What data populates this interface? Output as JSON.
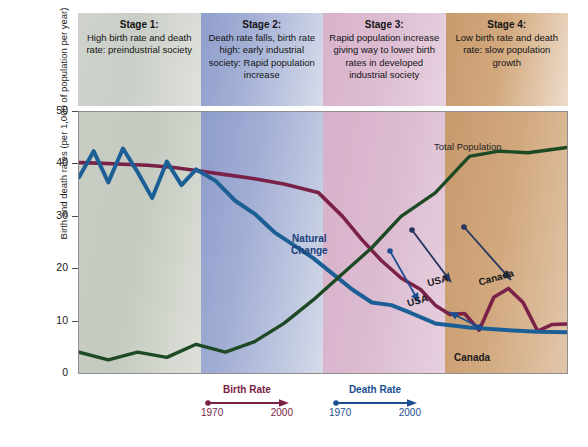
{
  "stages": [
    {
      "title": "Stage 1:",
      "description": "High birth rate and death rate: preindustrial society"
    },
    {
      "title": "Stage 2:",
      "description": "Death rate falls, birth rate high: early industrial society: Rapid population increase"
    },
    {
      "title": "Stage 3:",
      "description": "Rapid population increase giving way to lower birth rates in developed industrial society"
    },
    {
      "title": "Stage 4:",
      "description": "Low birth rate and death rate: slow population growth"
    }
  ],
  "axis": {
    "y_title": "Birth and death rates (per 1,000 of population per year)",
    "y_ticks": [
      "50",
      "40",
      "30",
      "20",
      "10",
      "0"
    ]
  },
  "annotations": {
    "total_population": "Total Population",
    "natural_change_line1": "Natural",
    "natural_change_line2": "Change",
    "usa_birth": "USA",
    "usa_death": "USA",
    "canada_birth": "Canada",
    "canada_death": "Canada"
  },
  "legend": {
    "birth": {
      "label": "Birth Rate",
      "year_start": "1970",
      "year_end": "2000",
      "color": "#7a2147"
    },
    "death": {
      "label": "Death Rate",
      "year_start": "1970",
      "year_end": "2000",
      "color": "#1b4f91"
    }
  },
  "chart_data": {
    "type": "line",
    "xlabel": "",
    "ylabel": "Birth and death rates (per 1,000 of population per year)",
    "ylim": [
      0,
      50
    ],
    "ytick_values": [
      0,
      10,
      20,
      30,
      40,
      50
    ],
    "grid": false,
    "legend_position": "bottom",
    "stage_boundaries_pct": [
      0,
      24,
      49,
      73,
      100
    ],
    "series": [
      {
        "name": "Birth Rate",
        "color": "#7a2147",
        "x": [
          0,
          4,
          9,
          14,
          19,
          24,
          30,
          36,
          42,
          49,
          54,
          58,
          62,
          66,
          70,
          73,
          76,
          79,
          82,
          85,
          88,
          91,
          94,
          97,
          100
        ],
        "values": [
          40.3,
          40.2,
          40.0,
          39.8,
          39.4,
          38.8,
          38.0,
          37.2,
          36.2,
          34.6,
          30.0,
          25.5,
          21.5,
          18.2,
          16.0,
          13.0,
          11.2,
          11.4,
          8.2,
          14.5,
          16.2,
          13.5,
          8.0,
          9.3,
          9.4
        ]
      },
      {
        "name": "Death Rate",
        "color": "#1b5f96",
        "x": [
          0,
          3,
          6,
          9,
          12,
          15,
          18,
          21,
          24,
          28,
          32,
          36,
          40,
          44,
          48,
          52,
          56,
          60,
          64,
          68,
          73,
          80,
          88,
          94,
          100
        ],
        "values": [
          37.5,
          42.5,
          36.5,
          43.0,
          38.5,
          33.5,
          40.5,
          36.0,
          39.0,
          36.8,
          33.0,
          30.5,
          27.0,
          24.5,
          22.0,
          19.0,
          16.0,
          13.5,
          13.0,
          11.5,
          9.5,
          8.7,
          8.2,
          7.9,
          7.8
        ]
      },
      {
        "name": "Total Population",
        "color": "#1d4a24",
        "x": [
          0,
          6,
          12,
          18,
          24,
          30,
          36,
          42,
          48,
          54,
          60,
          66,
          73,
          80,
          86,
          92,
          100
        ],
        "values": [
          4.0,
          2.5,
          4.0,
          3.0,
          5.5,
          4.0,
          6.0,
          9.5,
          14.0,
          19.0,
          24.0,
          30.0,
          34.5,
          41.5,
          42.5,
          42.2,
          43.2
        ]
      }
    ],
    "point_markers": [
      {
        "series": "Birth Rate",
        "label": "USA",
        "x": 80,
        "value": 16.0
      },
      {
        "series": "Death Rate",
        "label": "USA",
        "x": 75,
        "value": 8.6
      },
      {
        "series": "Birth Rate",
        "label": "Canada",
        "x": 86,
        "value": 16.2
      },
      {
        "series": "Death Rate",
        "label": "Canada",
        "x": 84,
        "value": 8.4
      }
    ]
  }
}
